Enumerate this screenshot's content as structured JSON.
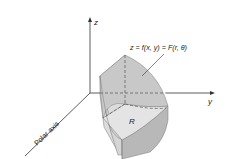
{
  "figure": {
    "axes": {
      "z_label": "z",
      "y_label": "y",
      "polar_axis_label": "Polar axis"
    },
    "surface_label": "z = f(x, y) = F(r, θ)",
    "region_label": "R"
  },
  "colors": {
    "axis": "#333333",
    "surface_top": "#c9c9c9",
    "side_left": "#dcdcdc",
    "side_right": "#b5b5b5",
    "side_front": "#d2d2d2",
    "region_base": "#e2e2e2",
    "dashed": "#555555",
    "edge": "#7a7a7a"
  }
}
